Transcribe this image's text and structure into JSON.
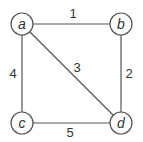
{
  "diagram": {
    "type": "weighted-undirected-graph",
    "colors": {
      "stroke": "#555555",
      "node_fill": "#ffffff",
      "text": "#333333"
    },
    "nodes": [
      {
        "id": "a",
        "label": "a",
        "x": 22,
        "y": 24
      },
      {
        "id": "b",
        "label": "b",
        "x": 121,
        "y": 24
      },
      {
        "id": "c",
        "label": "c",
        "x": 22,
        "y": 123
      },
      {
        "id": "d",
        "label": "d",
        "x": 121,
        "y": 123
      }
    ],
    "edges": [
      {
        "from": "a",
        "to": "b",
        "weight": "1",
        "lx": 73,
        "ly": 18
      },
      {
        "from": "b",
        "to": "d",
        "weight": "2",
        "lx": 129,
        "ly": 78
      },
      {
        "from": "a",
        "to": "d",
        "weight": "3",
        "lx": 77,
        "ly": 72
      },
      {
        "from": "a",
        "to": "c",
        "weight": "4",
        "lx": 13,
        "ly": 78
      },
      {
        "from": "c",
        "to": "d",
        "weight": "5",
        "lx": 70,
        "ly": 137
      }
    ]
  }
}
